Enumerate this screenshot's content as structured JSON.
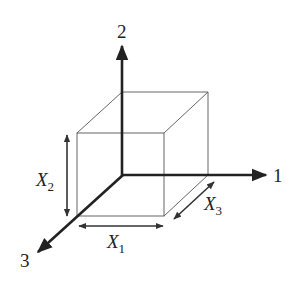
{
  "diagram": {
    "type": "3d-box-coordinate-axes",
    "axes": [
      {
        "id": "axis-1",
        "label": "1",
        "direction": "right"
      },
      {
        "id": "axis-2",
        "label": "2",
        "direction": "up"
      },
      {
        "id": "axis-3",
        "label": "3",
        "direction": "down-left"
      }
    ],
    "dimensions": [
      {
        "id": "X1",
        "symbol": "X",
        "subscript": "1",
        "along": "axis-1"
      },
      {
        "id": "X2",
        "symbol": "X",
        "subscript": "2",
        "along": "axis-2"
      },
      {
        "id": "X3",
        "symbol": "X",
        "subscript": "3",
        "along": "axis-3"
      }
    ]
  },
  "colors": {
    "ink": "#222222",
    "box": "#555555",
    "background": "#ffffff"
  }
}
